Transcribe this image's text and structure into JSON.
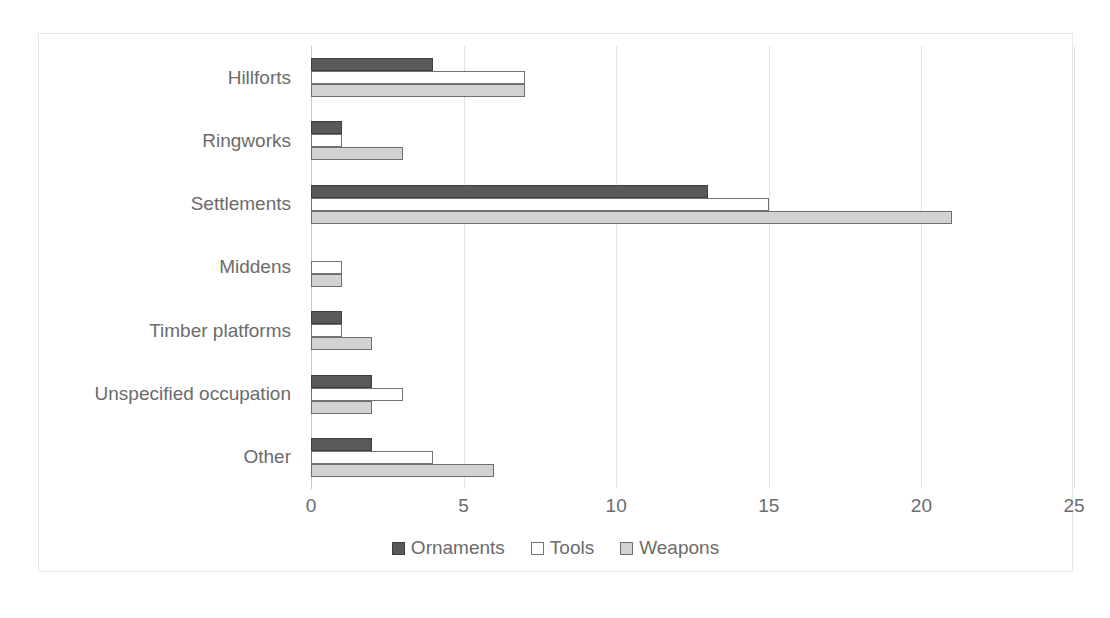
{
  "chart_data": {
    "type": "bar",
    "orientation": "horizontal",
    "title": "",
    "xlabel": "",
    "ylabel": "",
    "xlim": [
      0,
      25
    ],
    "xticks": [
      0,
      5,
      10,
      15,
      20,
      25
    ],
    "grid": true,
    "legend_position": "bottom",
    "categories": [
      "Hillforts",
      "Ringworks",
      "Settlements",
      "Middens",
      "Timber platforms",
      "Unspecified occupation",
      "Other"
    ],
    "series": [
      {
        "name": "Ornaments",
        "color": "#595959",
        "values": [
          4,
          1,
          13,
          0,
          1,
          2,
          2
        ]
      },
      {
        "name": "Tools",
        "color": "#ffffff",
        "values": [
          7,
          1,
          15,
          1,
          1,
          3,
          4
        ]
      },
      {
        "name": "Weapons",
        "color": "#d2d2d2",
        "values": [
          7,
          3,
          21,
          1,
          2,
          2,
          6
        ]
      }
    ]
  },
  "colors": {
    "frame_border": "#e8e8e8",
    "gridline": "#e3e3e3",
    "axis_line": "#c9c9c9",
    "text": "#6b6b6b"
  }
}
